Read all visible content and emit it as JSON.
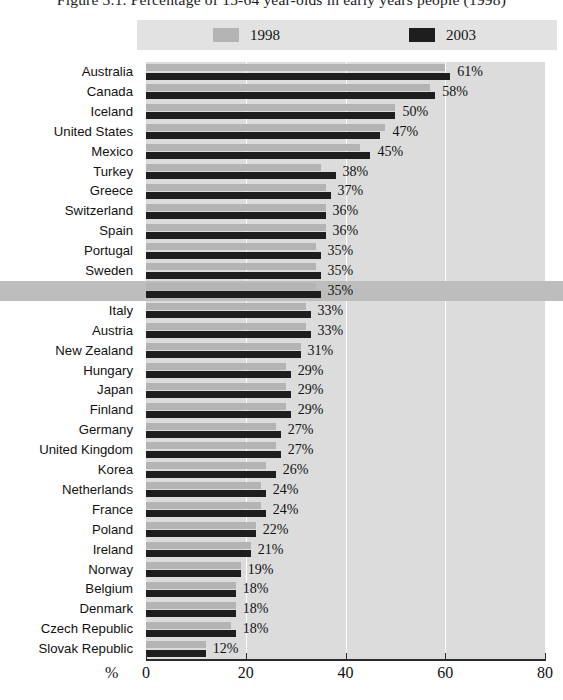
{
  "title": "Figure 3.1.  Percentage of 15-64 year-olds in early years people (1998)",
  "axis_unit": "%",
  "legend": {
    "items": [
      {
        "label": "1998",
        "color": "#b4b4b4",
        "swatch": "legend-swatch-1998"
      },
      {
        "label": "2003",
        "color": "#1e1e1e",
        "swatch": "legend-swatch-2003"
      }
    ]
  },
  "highlight_row": "OECD total",
  "highlight_color": "#bdbdbd",
  "chart_data": {
    "type": "bar",
    "orientation": "horizontal",
    "title": "Figure 3.1.  Percentage of 15-64 year-olds in early years people (1998)",
    "xlabel": "%",
    "ylabel": "",
    "xlim": [
      0,
      80
    ],
    "xticks": [
      0,
      20,
      40,
      60,
      80
    ],
    "xtick_labels": [
      "0",
      "20",
      "40",
      "60",
      "80"
    ],
    "grid": true,
    "legend_position": "top",
    "categories": [
      "Australia",
      "Canada",
      "Iceland",
      "United States",
      "Mexico",
      "Turkey",
      "Greece",
      "Switzerland",
      "Spain",
      "Portugal",
      "Sweden",
      "OECD total",
      "Italy",
      "Austria",
      "New Zealand",
      "Hungary",
      "Japan",
      "Finland",
      "Germany",
      "United Kingdom",
      "Korea",
      "Netherlands",
      "France",
      "Poland",
      "Ireland",
      "Norway",
      "Belgium",
      "Denmark",
      "Czech Republic",
      "Slovak Republic"
    ],
    "series": [
      {
        "name": "1998",
        "color": "#b4b4b4",
        "values": [
          60,
          57,
          50,
          48,
          43,
          35,
          36,
          36,
          36,
          34,
          34,
          34,
          32,
          32,
          31,
          28,
          28,
          28,
          26,
          26,
          24,
          23,
          23,
          22,
          21,
          19,
          18,
          18,
          17,
          12
        ]
      },
      {
        "name": "2003",
        "color": "#1e1e1e",
        "values": [
          61,
          58,
          50,
          47,
          45,
          38,
          37,
          36,
          36,
          35,
          35,
          35,
          33,
          33,
          31,
          29,
          29,
          29,
          27,
          27,
          26,
          24,
          24,
          22,
          21,
          19,
          18,
          18,
          18,
          12
        ]
      }
    ],
    "data_labels": [
      "61%",
      "58%",
      "50%",
      "47%",
      "45%",
      "38%",
      "37%",
      "36%",
      "36%",
      "35%",
      "35%",
      "35%",
      "33%",
      "33%",
      "31%",
      "29%",
      "29%",
      "29%",
      "27%",
      "27%",
      "26%",
      "24%",
      "24%",
      "22%",
      "21%",
      "19%",
      "18%",
      "18%",
      "18%",
      "12%"
    ]
  }
}
